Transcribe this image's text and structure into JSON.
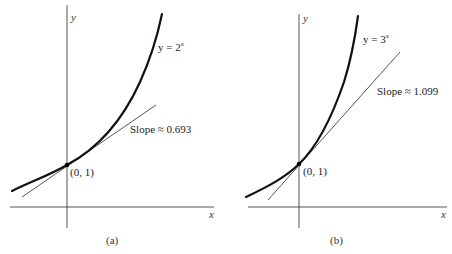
{
  "panels": [
    {
      "id": "a",
      "caption": "(a)",
      "function_label_prefix": "y = 2",
      "function_label_exponent": "x",
      "slope_label": "Slope ≈ 0.693",
      "point_label": "(0, 1)",
      "x_axis_label": "x",
      "y_axis_label": "y"
    },
    {
      "id": "b",
      "caption": "(b)",
      "function_label_prefix": "y = 3",
      "function_label_exponent": "x",
      "slope_label": "Slope ≈ 1.099",
      "point_label": "(0, 1)",
      "x_axis_label": "x",
      "y_axis_label": "y"
    }
  ],
  "colors": {
    "axis": "#444444",
    "curve": "#111111",
    "tangent": "#555555",
    "point": "#000000"
  }
}
